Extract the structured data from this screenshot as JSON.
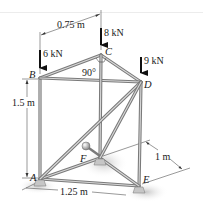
{
  "figure": {
    "type": "space-truss",
    "joints": [
      {
        "id": "A",
        "label": "A"
      },
      {
        "id": "B",
        "label": "B"
      },
      {
        "id": "C",
        "label": "C"
      },
      {
        "id": "D",
        "label": "D"
      },
      {
        "id": "E",
        "label": "E"
      },
      {
        "id": "F",
        "label": "F"
      }
    ],
    "loads": [
      {
        "joint": "B",
        "label": "6 kN",
        "value": 6,
        "unit": "kN",
        "direction": "down"
      },
      {
        "joint": "C",
        "label": "8 kN",
        "value": 8,
        "unit": "kN",
        "direction": "down"
      },
      {
        "joint": "D",
        "label": "9 kN",
        "value": 9,
        "unit": "kN",
        "direction": "down"
      }
    ],
    "dimensions": [
      {
        "id": "bc-horizontal",
        "label": "0.75 m",
        "value": 0.75,
        "unit": "m"
      },
      {
        "id": "ab-height",
        "label": "1.5 m",
        "value": 1.5,
        "unit": "m"
      },
      {
        "id": "ae-length",
        "label": "1.25 m",
        "value": 1.25,
        "unit": "m"
      },
      {
        "id": "ef-depth",
        "label": "1 m",
        "value": 1,
        "unit": "m"
      }
    ],
    "angle": {
      "at": "C",
      "label": "90°",
      "value": 90
    },
    "members": [
      [
        "A",
        "B"
      ],
      [
        "B",
        "C"
      ],
      [
        "C",
        "D"
      ],
      [
        "B",
        "D"
      ],
      [
        "A",
        "E"
      ],
      [
        "E",
        "D"
      ],
      [
        "A",
        "F"
      ],
      [
        "F",
        "E"
      ],
      [
        "F",
        "C"
      ],
      [
        "A",
        "D"
      ],
      [
        "F",
        "D"
      ]
    ],
    "colors": {
      "member": "#7a7a7a",
      "member_highlight": "#d8d8d8",
      "ink": "#111111",
      "support": "#bdbdbd",
      "shadow": "#cfcfcf"
    }
  }
}
